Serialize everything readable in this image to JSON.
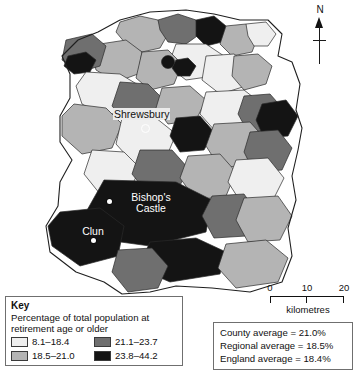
{
  "map": {
    "title": "Shropshire retirement age population choropleth map",
    "places": [
      {
        "name": "Shrewsbury",
        "marker": "ring"
      },
      {
        "name": "Bishop's",
        "name2": "Castle",
        "marker": "dot"
      },
      {
        "name": "Clun",
        "marker": "dot"
      }
    ],
    "north_arrow_label": "N"
  },
  "scale": {
    "ticks": [
      "0",
      "10",
      "20"
    ],
    "unit": "kilometres"
  },
  "key": {
    "title": "Key",
    "subtitle": "Percentage of total population at retirement age or older",
    "items": [
      {
        "range": "8.1–18.4",
        "color": "#efefef"
      },
      {
        "range": "21.1–23.7",
        "color": "#6f6f6f"
      },
      {
        "range": "18.5–21.0",
        "color": "#b4b4b4"
      },
      {
        "range": "23.8–44.2",
        "color": "#141414"
      }
    ]
  },
  "stats": {
    "lines": [
      "County average = 21.0%",
      "Regional average = 18.5%",
      "England average = 18.4%"
    ]
  },
  "chart_data": {
    "type": "map",
    "subtype": "choropleth",
    "title": "Percentage of total population at retirement age or older",
    "region": "Shropshire",
    "unit": "percent",
    "classes": [
      {
        "label": "8.1–18.4",
        "min": 8.1,
        "max": 18.4,
        "color": "#efefef"
      },
      {
        "label": "18.5–21.0",
        "min": 18.5,
        "max": 21.0,
        "color": "#b4b4b4"
      },
      {
        "label": "21.1–23.7",
        "min": 21.1,
        "max": 23.7,
        "color": "#6f6f6f"
      },
      {
        "label": "23.8–44.2",
        "min": 23.8,
        "max": 44.2,
        "color": "#141414"
      }
    ],
    "reference_values": [
      {
        "name": "County average",
        "value": 21.0
      },
      {
        "name": "Regional average",
        "value": 18.5
      },
      {
        "name": "England average",
        "value": 18.4
      }
    ],
    "scale_bar": {
      "values": [
        0,
        10,
        20
      ],
      "unit": "kilometres"
    },
    "labelled_places": [
      "Shrewsbury",
      "Bishop's Castle",
      "Clun"
    ],
    "regions": [
      {
        "id": "r1",
        "class": "18.5–21.0",
        "color": "#b4b4b4",
        "d": "M120,22 L140,16 L158,20 L168,34 L160,48 L142,52 L126,44 L116,32 Z"
      },
      {
        "id": "r2",
        "class": "21.1–23.7",
        "color": "#6f6f6f",
        "d": "M158,20 L178,14 L196,20 L200,34 L186,44 L168,42 L160,30 Z"
      },
      {
        "id": "r3",
        "class": "23.8–44.2",
        "color": "#141414",
        "d": "M196,20 L214,16 L226,26 L222,42 L206,46 L196,36 Z"
      },
      {
        "id": "r4",
        "class": "18.5–21.0",
        "color": "#b4b4b4",
        "d": "M226,26 L246,24 L258,36 L252,52 L232,56 L220,44 Z"
      },
      {
        "id": "r5",
        "class": "8.1–18.4",
        "color": "#efefef",
        "d": "M246,24 L266,22 L276,34 L268,46 L254,46 L248,36 Z"
      },
      {
        "id": "r6",
        "class": "8.1–18.4",
        "color": "#efefef",
        "d": "M176,44 L206,44 L224,56 L214,76 L186,80 L168,66 Z"
      },
      {
        "id": "r7",
        "class": "18.5–21.0",
        "color": "#b4b4b4",
        "d": "M100,44 L126,40 L142,52 L138,74 L116,82 L96,70 L92,54 Z"
      },
      {
        "id": "r8",
        "class": "21.1–23.7",
        "color": "#6f6f6f",
        "d": "M66,40 L92,34 L106,46 L100,66 L80,72 L62,60 Z"
      },
      {
        "id": "r9",
        "class": "23.8–44.2",
        "color": "#141414",
        "d": "M68,56 L86,52 L96,60 L90,72 L74,74 L64,66 Z"
      },
      {
        "id": "r10",
        "class": "18.5–21.0",
        "color": "#b4b4b4",
        "d": "M142,52 L168,50 L182,64 L174,84 L150,90 L136,78 Z"
      },
      {
        "id": "r11",
        "class": "8.1–18.4",
        "color": "#efefef",
        "d": "M206,56 L234,54 L250,66 L246,86 L220,94 L202,80 Z"
      },
      {
        "id": "r12",
        "class": "18.5–21.0",
        "color": "#b4b4b4",
        "d": "M234,56 L258,54 L272,66 L266,84 L244,90 L232,76 Z"
      },
      {
        "id": "r13",
        "class": "23.8–44.2",
        "color": "#141414",
        "d": "M176,60 L188,58 L196,66 L190,76 L178,76 L172,68 Z"
      },
      {
        "id": "r14",
        "class": "8.1–18.4",
        "color": "#efefef",
        "d": "M86,72 L120,74 L140,86 L134,108 L104,116 L82,104 L76,86 Z"
      },
      {
        "id": "r15",
        "class": "21.1–23.7",
        "color": "#6f6f6f",
        "d": "M120,82 L148,84 L162,98 L152,118 L126,122 L112,106 Z"
      },
      {
        "id": "r16",
        "class": "18.5–21.0",
        "color": "#b4b4b4",
        "d": "M162,88 L190,86 L206,100 L196,120 L168,124 L156,108 Z"
      },
      {
        "id": "r17",
        "class": "8.1–18.4",
        "color": "#efefef",
        "d": "M206,92 L244,90 L262,104 L252,128 L216,132 L200,114 Z"
      },
      {
        "id": "r18",
        "class": "21.1–23.7",
        "color": "#6f6f6f",
        "d": "M244,96 L270,94 L284,110 L274,130 L248,132 L238,114 Z"
      },
      {
        "id": "r19",
        "class": "23.8–44.2",
        "color": "#141414",
        "d": "M262,104 L286,100 L298,116 L288,136 L264,138 L256,120 Z"
      },
      {
        "id": "r20",
        "class": "18.5–21.0",
        "color": "#b4b4b4",
        "d": "M74,104 L106,108 L122,124 L112,148 L82,154 L62,136 L62,116 Z"
      },
      {
        "id": "r21",
        "class": "8.1–18.4",
        "color": "#efefef",
        "d": "M122,118 L156,118 L176,134 L166,158 L134,164 L116,144 Z"
      },
      {
        "id": "r22",
        "class": "23.8–44.2",
        "color": "#141414",
        "d": "M176,118 L200,116 L214,132 L204,150 L180,152 L170,136 Z"
      },
      {
        "id": "r23",
        "class": "18.5–21.0",
        "color": "#b4b4b4",
        "d": "M214,124 L250,122 L266,140 L254,164 L220,168 L206,146 Z"
      },
      {
        "id": "r24",
        "class": "21.1–23.7",
        "color": "#6f6f6f",
        "d": "M250,132 L278,130 L292,148 L282,170 L254,172 L244,152 Z"
      },
      {
        "id": "r25",
        "class": "8.1–18.4",
        "color": "#efefef",
        "d": "M92,150 L124,152 L140,168 L130,190 L100,194 L84,174 Z"
      },
      {
        "id": "r26",
        "class": "21.1–23.7",
        "color": "#6f6f6f",
        "d": "M140,150 L172,150 L188,168 L178,190 L148,194 L132,174 Z"
      },
      {
        "id": "r27",
        "class": "18.5–21.0",
        "color": "#b4b4b4",
        "d": "M188,156 L220,154 L236,172 L226,196 L196,200 L180,178 Z"
      },
      {
        "id": "r28",
        "class": "8.1–18.4",
        "color": "#efefef",
        "d": "M236,160 L268,158 L284,178 L272,202 L242,204 L228,182 Z"
      },
      {
        "id": "r29",
        "class": "23.8–44.2",
        "color": "#141414",
        "d": "M104,180 L176,182 L212,200 L206,232 L150,246 L106,240 L86,212 Z"
      },
      {
        "id": "r30",
        "class": "21.1–23.7",
        "color": "#6f6f6f",
        "d": "M212,196 L244,194 L258,214 L246,236 L214,238 L202,216 Z"
      },
      {
        "id": "r31",
        "class": "18.5–21.0",
        "color": "#b4b4b4",
        "d": "M244,198 L278,196 L292,216 L280,240 L248,242 L236,220 Z"
      },
      {
        "id": "r32",
        "class": "23.8–44.2",
        "color": "#141414",
        "d": "M60,212 L100,208 L124,226 L118,256 L80,266 L52,246 L48,226 Z"
      },
      {
        "id": "r33",
        "class": "23.8–44.2",
        "color": "#141414",
        "d": "M150,242 L196,238 L226,252 L220,274 L170,282 L138,268 Z"
      },
      {
        "id": "r34",
        "class": "18.5–21.0",
        "color": "#b4b4b4",
        "d": "M226,244 L266,240 L288,258 L278,282 L236,288 L218,268 Z"
      },
      {
        "id": "r35",
        "class": "21.1–23.7",
        "color": "#6f6f6f",
        "d": "M118,250 L152,248 L168,266 L158,288 L128,292 L112,272 Z"
      }
    ]
  }
}
